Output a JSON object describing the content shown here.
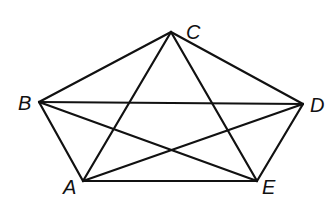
{
  "diagram": {
    "title": "",
    "stroke_color": "#111111",
    "background": "#ffffff",
    "vertices": [
      {
        "id": "A",
        "label": "A",
        "x": 83,
        "y": 181,
        "label_x": 63,
        "label_y": 194
      },
      {
        "id": "B",
        "label": "B",
        "x": 39,
        "y": 102,
        "label_x": 18,
        "label_y": 110
      },
      {
        "id": "C",
        "label": "C",
        "x": 171,
        "y": 32,
        "label_x": 186,
        "label_y": 39
      },
      {
        "id": "D",
        "label": "D",
        "x": 303,
        "y": 104,
        "label_x": 310,
        "label_y": 112
      },
      {
        "id": "E",
        "label": "E",
        "x": 257,
        "y": 181,
        "label_x": 262,
        "label_y": 194
      }
    ],
    "sides": [
      [
        "A",
        "B"
      ],
      [
        "B",
        "C"
      ],
      [
        "C",
        "D"
      ],
      [
        "D",
        "E"
      ],
      [
        "E",
        "A"
      ]
    ],
    "diagonals": [
      [
        "A",
        "C"
      ],
      [
        "A",
        "D"
      ],
      [
        "B",
        "D"
      ],
      [
        "B",
        "E"
      ],
      [
        "C",
        "E"
      ]
    ]
  }
}
